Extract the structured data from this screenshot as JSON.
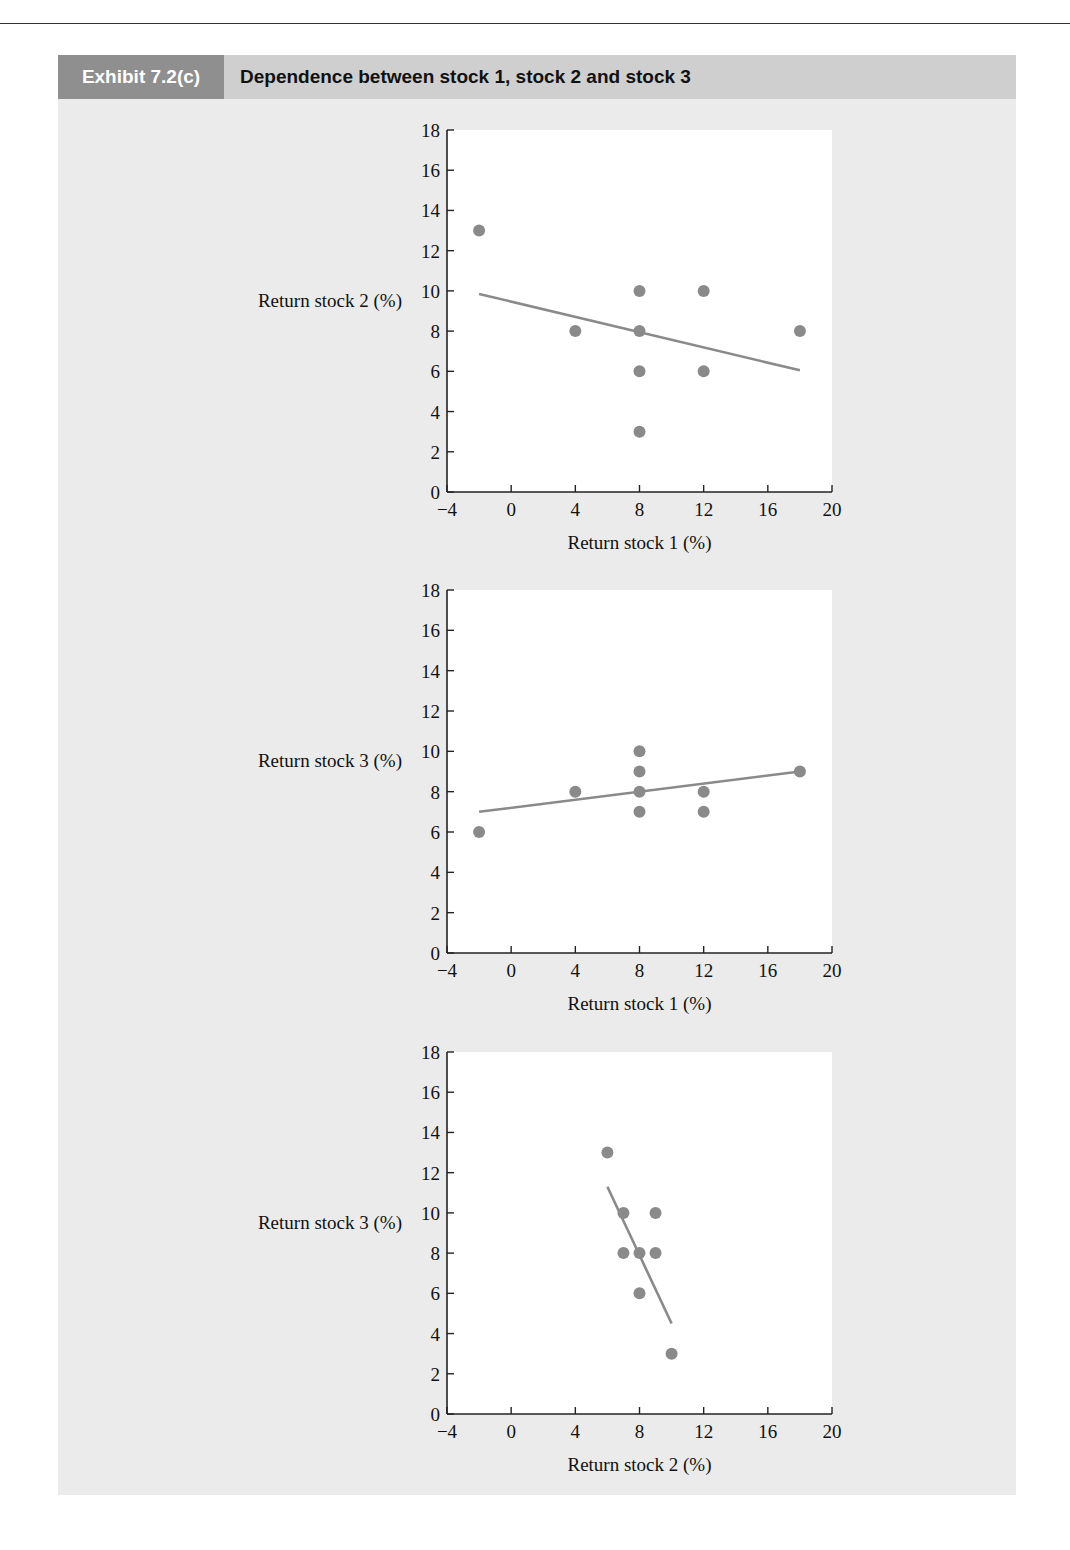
{
  "page": {
    "running_head": "TALS OF PORTFOLIO ANALYSIS"
  },
  "exhibit": {
    "label": "Exhibit 7.2(c)",
    "title": "Dependence between stock 1, stock 2 and stock 3"
  },
  "colors": {
    "panel_bg": "#ebebeb",
    "header_bg": "#cfcfcf",
    "label_bg": "#8f8f8f",
    "point": "#8a8a8a",
    "line": "#8a8a8a",
    "plot_bg": "#ffffff"
  },
  "chart_data": [
    {
      "type": "scatter",
      "title": "",
      "xlabel": "Return stock 1 (%)",
      "ylabel": "Return stock 2 (%)",
      "xlim": [
        -4,
        20
      ],
      "ylim": [
        0,
        18
      ],
      "xticks": [
        -4,
        0,
        4,
        8,
        12,
        16,
        20
      ],
      "yticks": [
        0,
        2,
        4,
        6,
        8,
        10,
        12,
        14,
        16,
        18
      ],
      "grid": false,
      "points": [
        {
          "x": -2,
          "y": 13
        },
        {
          "x": 4,
          "y": 8
        },
        {
          "x": 8,
          "y": 10
        },
        {
          "x": 8,
          "y": 8
        },
        {
          "x": 8,
          "y": 6
        },
        {
          "x": 8,
          "y": 3
        },
        {
          "x": 12,
          "y": 10
        },
        {
          "x": 12,
          "y": 6
        },
        {
          "x": 18,
          "y": 8
        }
      ],
      "trend_line": {
        "x1": -2,
        "y1": 9.85,
        "x2": 18,
        "y2": 6.05
      }
    },
    {
      "type": "scatter",
      "title": "",
      "xlabel": "Return stock 1 (%)",
      "ylabel": "Return stock 3 (%)",
      "xlim": [
        -4,
        20
      ],
      "ylim": [
        0,
        18
      ],
      "xticks": [
        -4,
        0,
        4,
        8,
        12,
        16,
        20
      ],
      "yticks": [
        0,
        2,
        4,
        6,
        8,
        10,
        12,
        14,
        16,
        18
      ],
      "grid": false,
      "points": [
        {
          "x": -2,
          "y": 6
        },
        {
          "x": 4,
          "y": 8
        },
        {
          "x": 8,
          "y": 10
        },
        {
          "x": 8,
          "y": 9
        },
        {
          "x": 8,
          "y": 8
        },
        {
          "x": 8,
          "y": 7
        },
        {
          "x": 12,
          "y": 8
        },
        {
          "x": 12,
          "y": 7
        },
        {
          "x": 18,
          "y": 9
        }
      ],
      "trend_line": {
        "x1": -2,
        "y1": 7.0,
        "x2": 18,
        "y2": 9.0
      }
    },
    {
      "type": "scatter",
      "title": "",
      "xlabel": "Return stock 2 (%)",
      "ylabel": "Return stock 3 (%)",
      "xlim": [
        -4,
        20
      ],
      "ylim": [
        0,
        18
      ],
      "xticks": [
        -4,
        0,
        4,
        8,
        12,
        16,
        20
      ],
      "yticks": [
        0,
        2,
        4,
        6,
        8,
        10,
        12,
        14,
        16,
        18
      ],
      "grid": false,
      "points": [
        {
          "x": 6,
          "y": 13
        },
        {
          "x": 7,
          "y": 10
        },
        {
          "x": 9,
          "y": 10
        },
        {
          "x": 7,
          "y": 8
        },
        {
          "x": 8,
          "y": 8
        },
        {
          "x": 9,
          "y": 8
        },
        {
          "x": 8,
          "y": 6
        },
        {
          "x": 10,
          "y": 3
        }
      ],
      "trend_line": {
        "x1": 6,
        "y1": 11.3,
        "x2": 10,
        "y2": 4.5
      }
    }
  ],
  "chart_layout": [
    {
      "plot_left": 447,
      "plot_right": 832,
      "plot_top": 130,
      "plot_bottom": 492
    },
    {
      "plot_left": 447,
      "plot_right": 832,
      "plot_top": 590,
      "plot_bottom": 953
    },
    {
      "plot_left": 447,
      "plot_right": 832,
      "plot_top": 1052,
      "plot_bottom": 1414
    }
  ]
}
